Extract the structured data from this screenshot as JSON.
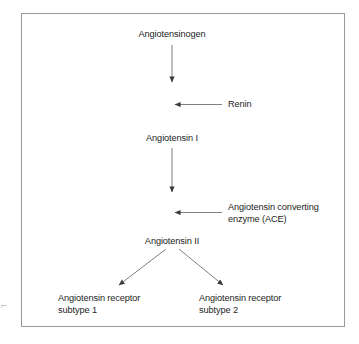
{
  "figure": {
    "border_color": "#9a9a9a",
    "text_color": "#1d1d1d",
    "arrow_color": "#444444",
    "background": "#ffffff"
  },
  "nodes": {
    "angiotensinogen": "Angiotensinogen",
    "renin": "Renin",
    "angiotensin_1": "Angiotensin I",
    "ace": "Angiotensin converting\nenzyme (ACE)",
    "angiotensin_2": "Angiotensin II",
    "receptor_subtype_1": "Angiotensin receptor\nsubtype 1",
    "receptor_subtype_2": "Angiotensin receptor\nsubtype 2"
  },
  "edges": [
    {
      "name": "angiotensinogen-to-angiotensin-1",
      "from": "Angiotensinogen",
      "to": "Angiotensin I",
      "direction": "down"
    },
    {
      "name": "renin-into-cascade",
      "from": "Renin",
      "to": "Angiotensinogen conversion",
      "direction": "left"
    },
    {
      "name": "angiotensin-1-to-angiotensin-2",
      "from": "Angiotensin I",
      "to": "Angiotensin II",
      "direction": "down"
    },
    {
      "name": "ace-into-cascade",
      "from": "Angiotensin converting enzyme (ACE)",
      "to": "Angiotensin I conversion",
      "direction": "left"
    },
    {
      "name": "angiotensin-2-to-receptor-1",
      "from": "Angiotensin II",
      "to": "Angiotensin receptor subtype 1",
      "direction": "down-left"
    },
    {
      "name": "angiotensin-2-to-receptor-2",
      "from": "Angiotensin II",
      "to": "Angiotensin receptor subtype 2",
      "direction": "down-right"
    }
  ],
  "artifact": {
    "edge_mark": "⌐"
  }
}
